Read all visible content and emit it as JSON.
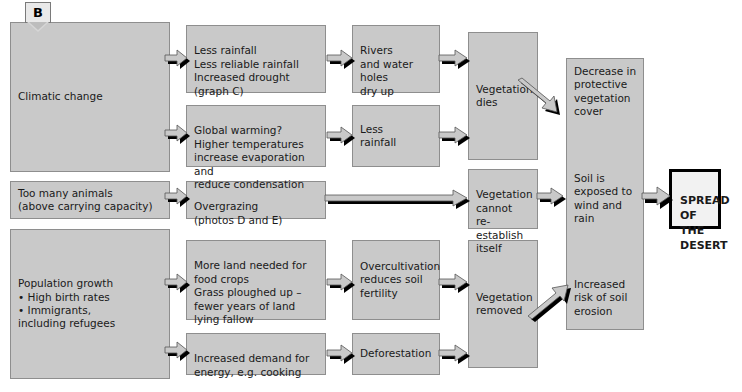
{
  "figure": {
    "label": "B",
    "caption_hidden": ""
  },
  "colors": {
    "box_fill": "#c9c9c9",
    "box_border": "#8e8e8e",
    "shadow": "#000000",
    "arrow_fill": "#c9c9c9",
    "arrow_stroke": "#555555",
    "terminal_fill": "#f2f2f2",
    "background": "#ffffff",
    "text": "#1a1a1a"
  },
  "nodes": {
    "climatic_change": "Climatic change",
    "too_many_animals": "Too many animals\n(above carrying capacity)",
    "population_growth": "Population growth\n• High birth rates\n• Immigrants,\n   including refugees",
    "less_rainfall_group": "Less rainfall\nLess reliable rainfall\nIncreased drought\n(graph C)",
    "global_warming": "Global warming?\nHigher temperatures\nincrease evaporation and\nreduce condensation",
    "overgrazing": "Overgrazing\n(photos D and E)",
    "more_land": "More land needed for\nfood crops\nGrass ploughed up –\nfewer years of land\nlying fallow",
    "increased_energy_demand": "Increased demand for\nenergy, e.g. cooking",
    "rivers_dry_up": "Rivers\nand water\nholes\ndry up",
    "less_rainfall": "Less\nrainfall",
    "overcultivation": "Overcultivation\nreduces soil\nfertility",
    "deforestation": "Deforestation",
    "vegetation_dies": "Vegetation\ndies",
    "vegetation_cannot_reestablish": "Vegetation\ncannot\nre-establish\nitself",
    "vegetation_removed": "Vegetation\nremoved",
    "decrease_protective_cover": "Decrease in\nprotective\nvegetation\ncover",
    "soil_exposed": "Soil is\nexposed to\nwind and\nrain",
    "increased_erosion_risk": "Increased\nrisk of soil\nerosion",
    "spread_of_desert": "SPREAD\nOF THE\nDESERT"
  },
  "arrows": [
    {
      "name": "climatic-change-to-less-rainfall-group",
      "direction": "right"
    },
    {
      "name": "climatic-change-to-global-warming",
      "direction": "right"
    },
    {
      "name": "less-rainfall-group-to-rivers-dry-up",
      "direction": "right"
    },
    {
      "name": "global-warming-to-less-rainfall",
      "direction": "right"
    },
    {
      "name": "rivers-dry-up-to-vegetation-dies",
      "direction": "right"
    },
    {
      "name": "less-rainfall-to-vegetation-dies",
      "direction": "right"
    },
    {
      "name": "too-many-animals-to-overgrazing",
      "direction": "right"
    },
    {
      "name": "overgrazing-to-vegetation-cannot-reestablish",
      "direction": "right-long"
    },
    {
      "name": "population-growth-to-more-land",
      "direction": "right"
    },
    {
      "name": "population-growth-to-increased-energy-demand",
      "direction": "right"
    },
    {
      "name": "more-land-to-overcultivation",
      "direction": "right"
    },
    {
      "name": "increased-energy-demand-to-deforestation",
      "direction": "right"
    },
    {
      "name": "overcultivation-to-vegetation-removed",
      "direction": "right"
    },
    {
      "name": "deforestation-to-vegetation-removed",
      "direction": "right"
    },
    {
      "name": "vegetation-dies-to-decrease-protective-cover",
      "direction": "down-right"
    },
    {
      "name": "vegetation-cannot-reestablish-to-soil-exposed",
      "direction": "right"
    },
    {
      "name": "vegetation-removed-to-increased-erosion-risk",
      "direction": "up-right"
    },
    {
      "name": "soil-exposed-to-spread-of-desert",
      "direction": "right"
    }
  ]
}
